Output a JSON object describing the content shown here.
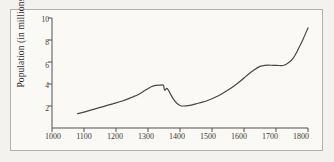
{
  "figure": {
    "background_color": "#f4f2ee",
    "frame_color": "#b4b0a8",
    "line_color": "#4a4845"
  },
  "chart_data": {
    "type": "line",
    "title": "",
    "xlabel": "",
    "ylabel": "Population (in millions)",
    "xlim": [
      1000,
      1800
    ],
    "ylim": [
      0,
      10
    ],
    "xticks": [
      1000,
      1100,
      1200,
      1300,
      1400,
      1500,
      1600,
      1700,
      1800
    ],
    "yticks": [
      2,
      4,
      6,
      8,
      10
    ],
    "grid": false,
    "legend": false,
    "series": [
      {
        "name": "Population",
        "x": [
          1080,
          1100,
          1130,
          1160,
          1190,
          1220,
          1250,
          1270,
          1290,
          1310,
          1325,
          1340,
          1348,
          1352,
          1360,
          1370,
          1380,
          1390,
          1400,
          1410,
          1430,
          1450,
          1470,
          1490,
          1510,
          1530,
          1550,
          1570,
          1590,
          1610,
          1630,
          1650,
          1665,
          1690,
          1710,
          1725,
          1740,
          1755,
          1770,
          1785,
          1800
        ],
        "y": [
          1.3,
          1.45,
          1.7,
          1.95,
          2.2,
          2.45,
          2.8,
          3.05,
          3.4,
          3.75,
          3.88,
          3.9,
          3.9,
          3.45,
          3.6,
          3.1,
          2.6,
          2.25,
          2.05,
          2.0,
          2.05,
          2.2,
          2.35,
          2.55,
          2.8,
          3.1,
          3.45,
          3.85,
          4.3,
          4.8,
          5.25,
          5.6,
          5.7,
          5.7,
          5.68,
          5.7,
          5.95,
          6.4,
          7.2,
          8.1,
          9.1
        ]
      }
    ],
    "annotations": []
  },
  "axis": {
    "ytick_labels": [
      "10",
      "8",
      "6",
      "4",
      "2"
    ],
    "xtick_labels": [
      "1000",
      "1100",
      "1200",
      "1300",
      "1400",
      "1500",
      "1600",
      "1700",
      "1800"
    ]
  }
}
